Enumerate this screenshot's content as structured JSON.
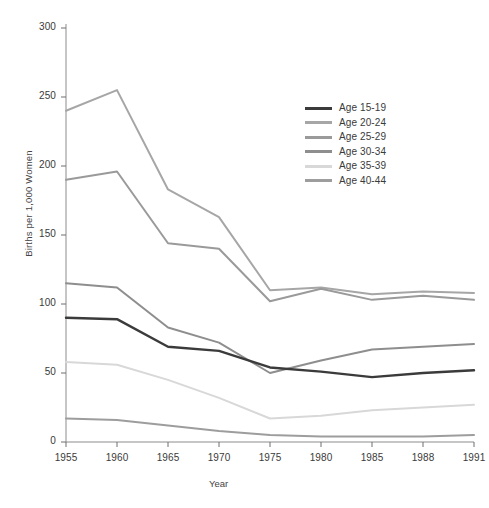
{
  "chart_data": {
    "type": "line",
    "title": "",
    "xlabel": "Year",
    "ylabel": "Births per 1,000 Women",
    "categories": [
      "1955",
      "1960",
      "1965",
      "1970",
      "1975",
      "1980",
      "1985",
      "1988",
      "1991"
    ],
    "ylim": [
      0,
      300
    ],
    "yticks": [
      "0",
      "50",
      "100",
      "150",
      "200",
      "250",
      "300"
    ],
    "grid": false,
    "legend_position": "upper-right-inside",
    "series": [
      {
        "name": "Age 15-19",
        "color": "#3b3b3b",
        "values": [
          90,
          89,
          69,
          66,
          54,
          51,
          47,
          50,
          52
        ]
      },
      {
        "name": "Age 20-24",
        "color": "#a6a6a6",
        "values": [
          240,
          255,
          183,
          163,
          110,
          112,
          107,
          109,
          108
        ]
      },
      {
        "name": "Age 25-29",
        "color": "#9a9a9a",
        "values": [
          190,
          196,
          144,
          140,
          102,
          111,
          103,
          106,
          103
        ]
      },
      {
        "name": "Age 30-34",
        "color": "#8e8e8e",
        "values": [
          115,
          112,
          83,
          72,
          50,
          59,
          67,
          69,
          71
        ]
      },
      {
        "name": "Age 35-39",
        "color": "#d8d8d8",
        "values": [
          58,
          56,
          45,
          32,
          17,
          19,
          23,
          25,
          27
        ]
      },
      {
        "name": "Age 40-44",
        "color": "#9d9d9d",
        "values": [
          17,
          16,
          12,
          8,
          5,
          4,
          4,
          4,
          5
        ]
      }
    ]
  }
}
